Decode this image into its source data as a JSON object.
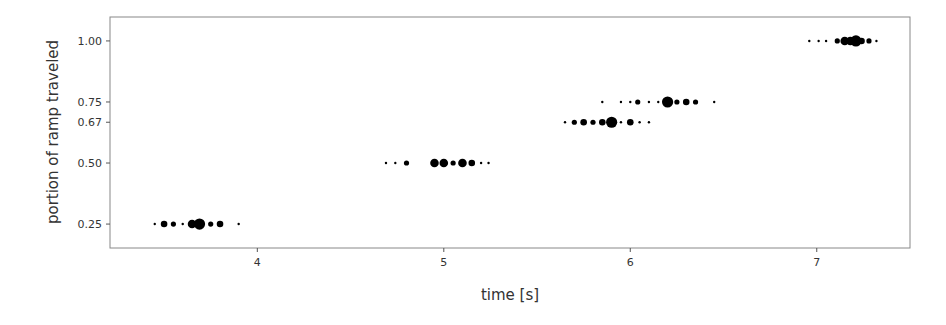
{
  "chart_data": {
    "type": "scatter",
    "title": "",
    "xlabel": "time [s]",
    "ylabel": "portion of ramp traveled",
    "xlim": [
      3.21,
      7.5
    ],
    "ylim": [
      0.152,
      1.098
    ],
    "xticks": [
      4,
      5,
      6,
      7
    ],
    "xtick_labels": [
      "4",
      "5",
      "6",
      "7"
    ],
    "yticks": [
      0.25,
      0.5,
      0.667,
      0.75,
      1.0
    ],
    "ytick_labels": [
      "0.25",
      "0.50",
      "0.67",
      "0.75",
      "1.00"
    ],
    "grid": false,
    "legend": null,
    "marker_color": "#000000",
    "series": [
      {
        "name": "0.25",
        "y": 0.25,
        "x": [
          3.45,
          3.5,
          3.55,
          3.6,
          3.65,
          3.69,
          3.75,
          3.8,
          3.9
        ],
        "sizes": [
          1,
          3,
          2,
          1,
          4,
          5,
          2,
          3,
          1
        ]
      },
      {
        "name": "0.50",
        "y": 0.5,
        "x": [
          4.69,
          4.74,
          4.8,
          4.95,
          5.0,
          5.05,
          5.1,
          5.15,
          5.2,
          5.24
        ],
        "sizes": [
          1,
          1,
          2,
          4,
          4,
          2,
          4,
          3,
          1,
          1
        ]
      },
      {
        "name": "0.67",
        "y": 0.667,
        "x": [
          5.65,
          5.7,
          5.75,
          5.8,
          5.85,
          5.9,
          5.95,
          6.0,
          6.05,
          6.1
        ],
        "sizes": [
          1,
          2,
          3,
          2,
          3,
          5,
          1,
          3,
          1,
          1
        ]
      },
      {
        "name": "0.75",
        "y": 0.75,
        "x": [
          5.85,
          5.95,
          6.0,
          6.04,
          6.1,
          6.15,
          6.2,
          6.25,
          6.3,
          6.35,
          6.45
        ],
        "sizes": [
          1,
          1,
          1,
          2,
          1,
          1,
          5,
          2,
          3,
          2,
          1
        ]
      },
      {
        "name": "1.00",
        "y": 1.0,
        "x": [
          6.96,
          7.01,
          7.05,
          7.11,
          7.15,
          7.18,
          7.21,
          7.24,
          7.28,
          7.32
        ],
        "sizes": [
          1,
          1,
          1,
          2,
          4,
          4,
          5,
          3,
          2,
          1
        ]
      }
    ]
  }
}
